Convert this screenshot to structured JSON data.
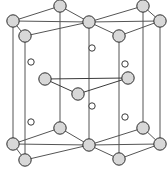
{
  "figure": {
    "background_color": "#ffffff"
  },
  "style": {
    "bond_color": "#3a3a3a",
    "bond_width": 1.0,
    "cell_edge_color": "#555555",
    "cell_edge_width": 1.0,
    "large_atom_fill": "#d8d8d8",
    "large_atom_stroke": "#2b2b2b",
    "large_atom_stroke_width": 1.0,
    "large_atom_radius": 6.2,
    "small_atom_fill": "#ffffff",
    "small_atom_stroke": "#3a3a3a",
    "small_atom_stroke_width": 1.0,
    "small_atom_radius": 3.2
  },
  "chart_data": {
    "type": "scatter",
    "xlabel": "",
    "ylabel": "",
    "xlim": [
      0,
      167
    ],
    "ylim": [
      0,
      172
    ],
    "grid": false,
    "legend": false,
    "series": [
      {
        "name": "large-atoms-top",
        "marker": "large-sphere",
        "points": [
          {
            "id": "T-back-left",
            "x": 60,
            "y": 6
          },
          {
            "id": "T-back-right",
            "x": 143,
            "y": 6
          },
          {
            "id": "T-left",
            "x": 13,
            "y": 21
          },
          {
            "id": "T-center",
            "x": 89,
            "y": 22
          },
          {
            "id": "T-right",
            "x": 160,
            "y": 21
          },
          {
            "id": "T-front-left",
            "x": 25,
            "y": 36
          },
          {
            "id": "T-front-right",
            "x": 119,
            "y": 36
          }
        ]
      },
      {
        "name": "large-atoms-interior",
        "marker": "large-sphere",
        "points": [
          {
            "id": "M-left",
            "x": 45,
            "y": 79
          },
          {
            "id": "M-right",
            "x": 128,
            "y": 78
          },
          {
            "id": "M-front",
            "x": 78,
            "y": 94
          }
        ]
      },
      {
        "name": "large-atoms-bottom",
        "marker": "large-sphere",
        "points": [
          {
            "id": "B-back-left",
            "x": 60,
            "y": 128
          },
          {
            "id": "B-back-right",
            "x": 143,
            "y": 128
          },
          {
            "id": "B-left",
            "x": 13,
            "y": 144
          },
          {
            "id": "B-center",
            "x": 89,
            "y": 145
          },
          {
            "id": "B-right",
            "x": 160,
            "y": 144
          },
          {
            "id": "B-front-left",
            "x": 25,
            "y": 160
          },
          {
            "id": "B-front-right",
            "x": 119,
            "y": 159
          }
        ]
      },
      {
        "name": "small-atoms",
        "marker": "small-open-circle",
        "points": [
          {
            "id": "S-top-center",
            "x": 92,
            "y": 48
          },
          {
            "id": "S-upper-left",
            "x": 31,
            "y": 62
          },
          {
            "id": "S-upper-right",
            "x": 125,
            "y": 64
          },
          {
            "id": "S-lower-center",
            "x": 92,
            "y": 106
          },
          {
            "id": "S-lower-left",
            "x": 31,
            "y": 122
          },
          {
            "id": "S-lower-right",
            "x": 125,
            "y": 117
          }
        ]
      }
    ],
    "cell_edges": [
      {
        "from": "T-left",
        "to": "T-back-left"
      },
      {
        "from": "T-back-left",
        "to": "T-center"
      },
      {
        "from": "T-center",
        "to": "T-back-right"
      },
      {
        "from": "T-back-right",
        "to": "T-right"
      },
      {
        "from": "T-right",
        "to": "T-front-right"
      },
      {
        "from": "T-front-right",
        "to": "T-center"
      },
      {
        "from": "T-center",
        "to": "T-front-left"
      },
      {
        "from": "T-front-left",
        "to": "T-left"
      },
      {
        "from": "T-left",
        "to": "T-center"
      },
      {
        "from": "T-center",
        "to": "T-right"
      },
      {
        "from": "B-left",
        "to": "B-back-left"
      },
      {
        "from": "B-back-left",
        "to": "B-center"
      },
      {
        "from": "B-center",
        "to": "B-back-right"
      },
      {
        "from": "B-back-right",
        "to": "B-right"
      },
      {
        "from": "B-right",
        "to": "B-front-right"
      },
      {
        "from": "B-front-right",
        "to": "B-center"
      },
      {
        "from": "B-center",
        "to": "B-front-left"
      },
      {
        "from": "B-front-left",
        "to": "B-left"
      },
      {
        "from": "B-left",
        "to": "B-center"
      },
      {
        "from": "B-center",
        "to": "B-right"
      },
      {
        "from": "T-left",
        "to": "B-left"
      },
      {
        "from": "T-back-left",
        "to": "B-back-left"
      },
      {
        "from": "T-center",
        "to": "B-center"
      },
      {
        "from": "T-back-right",
        "to": "B-back-right"
      },
      {
        "from": "T-right",
        "to": "B-right"
      },
      {
        "from": "T-front-left",
        "to": "B-front-left"
      },
      {
        "from": "T-front-right",
        "to": "B-front-right"
      }
    ],
    "bonds": [
      {
        "from": "M-left",
        "to": "M-front"
      },
      {
        "from": "M-front",
        "to": "M-right"
      },
      {
        "from": "M-left",
        "to": "M-right"
      }
    ]
  }
}
